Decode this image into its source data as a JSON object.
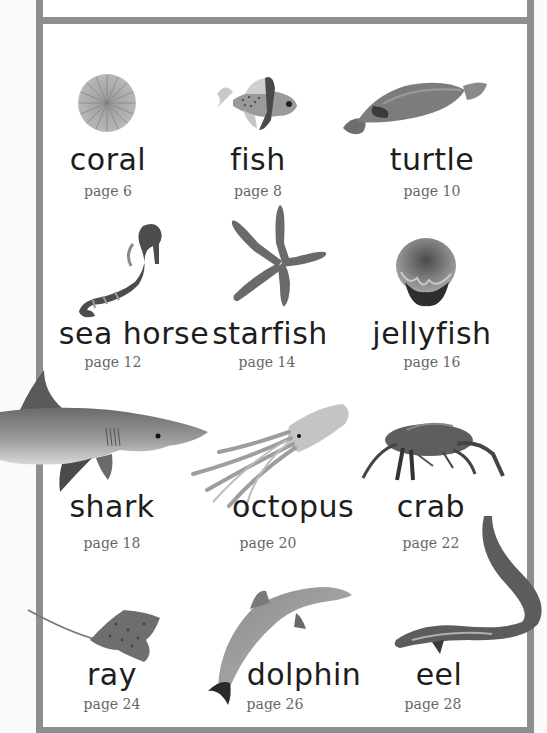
{
  "page": {
    "type": "children's picture dictionary contents",
    "colors": {
      "border": "#8e8e8e",
      "panel": "#ffffff",
      "text": "#1d1d1d",
      "page_text": "#666666"
    }
  },
  "entries": [
    {
      "word": "coral",
      "page": "page 6",
      "icon": "coral-image"
    },
    {
      "word": "fish",
      "page": "page 8",
      "icon": "fish-image"
    },
    {
      "word": "turtle",
      "page": "page 10",
      "icon": "turtle-image"
    },
    {
      "word": "sea horse",
      "page": "page 12",
      "icon": "sea-horse-image"
    },
    {
      "word": "starfish",
      "page": "page 14",
      "icon": "starfish-image"
    },
    {
      "word": "jellyfish",
      "page": "page 16",
      "icon": "jellyfish-image"
    },
    {
      "word": "shark",
      "page": "page 18",
      "icon": "shark-image"
    },
    {
      "word": "octopus",
      "page": "page 20",
      "icon": "octopus-image"
    },
    {
      "word": "crab",
      "page": "page 22",
      "icon": "crab-image"
    },
    {
      "word": "ray",
      "page": "page 24",
      "icon": "ray-image"
    },
    {
      "word": "dolphin",
      "page": "page 26",
      "icon": "dolphin-image"
    },
    {
      "word": "eel",
      "page": "page 28",
      "icon": "eel-image"
    }
  ]
}
